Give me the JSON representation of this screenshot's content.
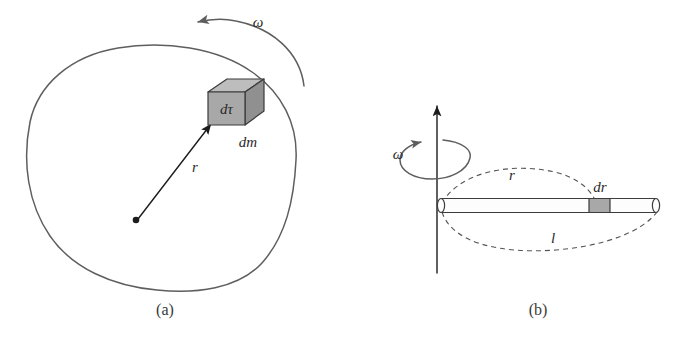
{
  "figure": {
    "background_color": "#ffffff",
    "line_color": "#5e5e5e",
    "ink_color": "#1c1c1c",
    "dashed_color": "#555555"
  },
  "panel_a": {
    "caption": "(a)",
    "omega_label": "ω",
    "volume_element_label": "dτ",
    "mass_element_label": "dm",
    "radius_label": "r",
    "body_shape": "irregular-closed-blob",
    "element_fill_front": "#a6a6a6",
    "element_fill_top": "#bdbdbd",
    "element_fill_side": "#8f8f8f"
  },
  "panel_b": {
    "caption": "(b)",
    "omega_label": "ω",
    "radius_label": "r",
    "length_label": "l",
    "element_label": "dr",
    "rod_fill": "#fdfdfd",
    "element_fill": "#a6a6a6",
    "axis_direction": "vertical-up"
  }
}
